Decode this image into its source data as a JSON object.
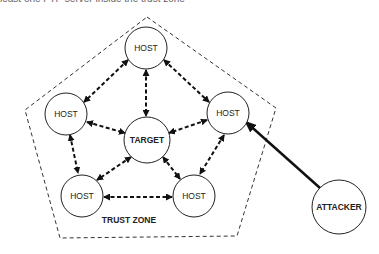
{
  "caption": "least one FTP server inside the trust zone",
  "zone": {
    "label": "TRUST ZONE"
  },
  "nodes": {
    "host_top": "HOST",
    "host_left": "HOST",
    "host_right": "HOST",
    "host_bottom_left": "HOST",
    "host_bottom_right": "HOST",
    "target": "TARGET",
    "attacker": "ATTACKER"
  },
  "colors": {
    "stroke": "#222222",
    "background": "#ffffff"
  }
}
